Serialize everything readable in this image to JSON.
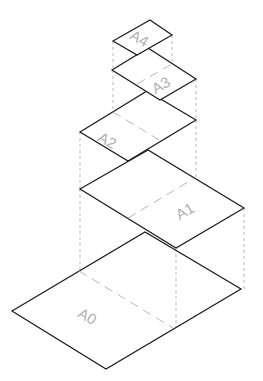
{
  "diagram": {
    "title": "",
    "sheets": [
      {
        "label": "A4"
      },
      {
        "label": "A3"
      },
      {
        "label": "A2"
      },
      {
        "label": "A1"
      },
      {
        "label": "A0"
      }
    ],
    "colors": {
      "outline": "#1a1a1a",
      "label": "#b0b0b0",
      "dashed": "#9a9a9a"
    }
  }
}
